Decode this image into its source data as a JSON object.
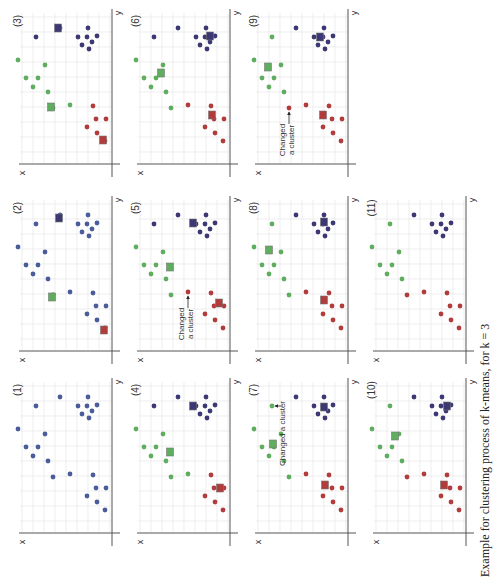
{
  "figure": {
    "orientation": "rotated 90deg counter-clockwise",
    "caption": "Example for clustering process of k-means, for k = 3",
    "axis_labels": {
      "x": "x",
      "y": "y"
    },
    "colors": {
      "initial": "#4a5d9a",
      "cluster_purple": "#3b3873",
      "cluster_green": "#5fae5f",
      "cluster_red": "#b23b3b",
      "grid": "#e6e6e6",
      "axis": "#555555"
    },
    "points": [
      [
        18,
        69
      ],
      [
        36,
        46
      ],
      [
        60,
        37
      ],
      [
        88,
        37
      ],
      [
        78,
        46
      ],
      [
        87,
        46
      ],
      [
        97,
        45
      ],
      [
        92,
        51
      ],
      [
        82,
        54
      ],
      [
        89,
        58
      ],
      [
        45,
        74
      ],
      [
        26,
        87
      ],
      [
        38,
        87
      ],
      [
        33,
        96
      ],
      [
        48,
        101
      ],
      [
        53,
        117
      ],
      [
        70,
        114
      ],
      [
        93,
        115
      ],
      [
        96,
        128
      ],
      [
        106,
        128
      ],
      [
        87,
        136
      ],
      [
        97,
        142
      ],
      [
        105,
        150
      ]
    ],
    "panels": [
      {
        "label": "(1)",
        "col": 0,
        "row": 2,
        "assign": "BBBBBBBBBBBBBBBBBBBBBBB",
        "centroids": []
      },
      {
        "label": "(2)",
        "col": 0,
        "row": 1,
        "assign": "BBBBBBBBBBBBBBBBBBBBBBB",
        "centroids": [
          {
            "c": "P",
            "x": 59,
            "y": 40
          },
          {
            "c": "G",
            "x": 52,
            "y": 119
          },
          {
            "c": "R",
            "x": 104,
            "y": 152
          }
        ]
      },
      {
        "label": "(3)",
        "col": 0,
        "row": 0,
        "assign": "GPPPPPPPPPGGGGGGGRRRRRR",
        "centroids": [
          {
            "c": "P",
            "x": 58,
            "y": 37
          },
          {
            "c": "G",
            "x": 51,
            "y": 116
          },
          {
            "c": "R",
            "x": 103,
            "y": 149
          }
        ]
      },
      {
        "label": "(4)",
        "col": 1,
        "row": 2,
        "assign": "GPPPPPPPPPGGGGGGGRRRRRR",
        "centroids": [
          {
            "c": "P",
            "x": 75,
            "y": 46
          },
          {
            "c": "G",
            "x": 52,
            "y": 92
          },
          {
            "c": "R",
            "x": 102,
            "y": 128
          }
        ]
      },
      {
        "label": "(5)",
        "col": 1,
        "row": 1,
        "assign": "GPPPPPPPPPGGGGGGRRRRRRR",
        "centroids": [
          {
            "c": "P",
            "x": 75,
            "y": 45
          },
          {
            "c": "G",
            "x": 52,
            "y": 89
          },
          {
            "c": "R",
            "x": 101,
            "y": 125
          }
        ],
        "annotation": {
          "text": [
            "Changed",
            "a cluster"
          ],
          "target": 16
        }
      },
      {
        "label": "(6)",
        "col": 1,
        "row": 0,
        "assign": "GPPPPPPPPPGGGGGGRRRRRRR",
        "centroids": [
          {
            "c": "P",
            "x": 92,
            "y": 45
          },
          {
            "c": "G",
            "x": 43,
            "y": 82
          },
          {
            "c": "R",
            "x": 94,
            "y": 124
          }
        ]
      },
      {
        "label": "(7)",
        "col": 2,
        "row": 2,
        "assign": "GGPPPPPPPPGGGGGGRRRRRRR",
        "centroids": [
          {
            "c": "P",
            "x": 88,
            "y": 47
          },
          {
            "c": "G",
            "x": 37,
            "y": 84
          },
          {
            "c": "R",
            "x": 89,
            "y": 125
          }
        ],
        "annotation": {
          "text": [
            "Changed a cluster"
          ],
          "target": 1
        }
      },
      {
        "label": "(8)",
        "col": 2,
        "row": 1,
        "assign": "GGPPPPPPPPGGGGGGRRRRRRR",
        "centroids": [
          {
            "c": "P",
            "x": 88,
            "y": 44
          },
          {
            "c": "G",
            "x": 33,
            "y": 72
          },
          {
            "c": "R",
            "x": 88,
            "y": 122
          }
        ]
      },
      {
        "label": "(9)",
        "col": 2,
        "row": 0,
        "assign": "GGPPPPPPPPGGGGGRRRRRRRR",
        "centroids": [
          {
            "c": "P",
            "x": 84,
            "y": 46
          },
          {
            "c": "G",
            "x": 32,
            "y": 76
          },
          {
            "c": "R",
            "x": 87,
            "y": 124
          }
        ],
        "annotation": {
          "text": [
            "Changed",
            "a cluster"
          ],
          "target": 15
        }
      },
      {
        "label": "(10)",
        "col": 3,
        "row": 2,
        "assign": "GGPPPPPPPPGGGGGRRRRRRRR",
        "centroids": [
          {
            "c": "P",
            "x": 93,
            "y": 46
          },
          {
            "c": "G",
            "x": 41,
            "y": 76
          },
          {
            "c": "R",
            "x": 90,
            "y": 125
          }
        ]
      },
      {
        "label": "(11)",
        "col": 3,
        "row": 1,
        "assign": "GGPPPPPPPPGGGGGRRRRRRRR",
        "centroids": []
      }
    ]
  },
  "chart_data": {
    "type": "scatter",
    "title": "Example for clustering process of k-means, for k = 3",
    "xlabel": "x",
    "ylabel": "y",
    "grid": true,
    "panels": [
      "(1)",
      "(2)",
      "(3)",
      "(4)",
      "(5)",
      "(6)",
      "(7)",
      "(8)",
      "(9)",
      "(10)",
      "(11)"
    ],
    "k": 3,
    "annotations": [
      {
        "panel": "(5)",
        "text": "Changed a cluster"
      },
      {
        "panel": "(7)",
        "text": "Changed a cluster"
      },
      {
        "panel": "(9)",
        "text": "Changed a cluster"
      }
    ],
    "series": [
      {
        "name": "initial (unassigned)",
        "panels": [
          "(1)",
          "(2)"
        ]
      },
      {
        "name": "cluster purple",
        "panels": [
          "(3)",
          "(4)",
          "(5)",
          "(6)",
          "(7)",
          "(8)",
          "(9)",
          "(10)",
          "(11)"
        ]
      },
      {
        "name": "cluster green",
        "panels": [
          "(3)",
          "(4)",
          "(5)",
          "(6)",
          "(7)",
          "(8)",
          "(9)",
          "(10)",
          "(11)"
        ]
      },
      {
        "name": "cluster red",
        "panels": [
          "(3)",
          "(4)",
          "(5)",
          "(6)",
          "(7)",
          "(8)",
          "(9)",
          "(10)",
          "(11)"
        ]
      }
    ]
  }
}
